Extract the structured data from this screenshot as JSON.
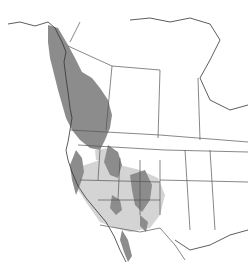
{
  "map": {
    "type": "species-range-map",
    "region": "Western North America",
    "colors": {
      "background": "#ffffff",
      "range_dark": "#8c8c8c",
      "range_light": "#d4d4d4",
      "borders": "#555555",
      "coastline": "#333333"
    },
    "layers": [
      {
        "name": "dark-range",
        "description": "Primary range: Pacific coast from southern Alaska through British Columbia, Rocky Mountains, Sierra Nevada, and mountain ranges of the Southwest and Baja"
      },
      {
        "name": "light-range",
        "description": "Secondary range: Great Basin, Colorado Plateau, and southwestern interior"
      }
    ]
  }
}
